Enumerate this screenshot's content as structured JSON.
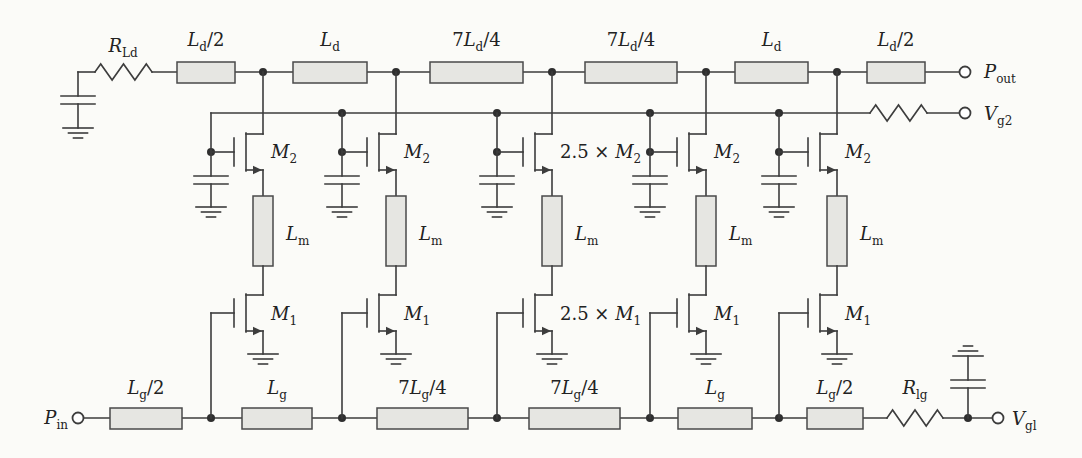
{
  "figure": {
    "kind": "circuit-schematic"
  },
  "colors": {
    "line": "#3d3d3d",
    "inductor_fill": "#e6e6e2",
    "background": "#fbfbf8",
    "text": "#222222"
  },
  "drain_line": {
    "termination_resistor_label": [
      {
        "t": "R",
        "i": true
      },
      {
        "t": "Ld",
        "s": true
      }
    ],
    "inductor_labels": [
      [
        {
          "t": "L",
          "i": true
        },
        {
          "t": "d",
          "s": true
        },
        {
          "t": "/2"
        }
      ],
      [
        {
          "t": "L",
          "i": true
        },
        {
          "t": "d",
          "s": true
        }
      ],
      [
        {
          "t": "7"
        },
        {
          "t": "L",
          "i": true
        },
        {
          "t": "d",
          "s": true
        },
        {
          "t": "/4"
        }
      ],
      [
        {
          "t": "7"
        },
        {
          "t": "L",
          "i": true
        },
        {
          "t": "d",
          "s": true
        },
        {
          "t": "/4"
        }
      ],
      [
        {
          "t": "L",
          "i": true
        },
        {
          "t": "d",
          "s": true
        }
      ],
      [
        {
          "t": "L",
          "i": true
        },
        {
          "t": "d",
          "s": true
        },
        {
          "t": "/2"
        }
      ]
    ],
    "output_terminal_label": [
      {
        "t": "P",
        "i": true
      },
      {
        "t": "out",
        "s": true
      }
    ]
  },
  "gate2_bias": {
    "terminal_label": [
      {
        "t": "V",
        "i": true
      },
      {
        "t": "g2",
        "s": true
      }
    ]
  },
  "cells": [
    {
      "m2_label": [
        {
          "t": "M",
          "i": true
        },
        {
          "t": "2",
          "s": true
        }
      ],
      "lm_label": [
        {
          "t": "L",
          "i": true
        },
        {
          "t": "m",
          "s": true
        }
      ],
      "m1_label": [
        {
          "t": "M",
          "i": true
        },
        {
          "t": "1",
          "s": true
        }
      ]
    },
    {
      "m2_label": [
        {
          "t": "M",
          "i": true
        },
        {
          "t": "2",
          "s": true
        }
      ],
      "lm_label": [
        {
          "t": "L",
          "i": true
        },
        {
          "t": "m",
          "s": true
        }
      ],
      "m1_label": [
        {
          "t": "M",
          "i": true
        },
        {
          "t": "1",
          "s": true
        }
      ]
    },
    {
      "m2_label": [
        {
          "t": "2.5 × "
        },
        {
          "t": "M",
          "i": true
        },
        {
          "t": "2",
          "s": true
        }
      ],
      "lm_label": [
        {
          "t": "L",
          "i": true
        },
        {
          "t": "m",
          "s": true
        }
      ],
      "m1_label": [
        {
          "t": "2.5 × "
        },
        {
          "t": "M",
          "i": true
        },
        {
          "t": "1",
          "s": true
        }
      ]
    },
    {
      "m2_label": [
        {
          "t": "M",
          "i": true
        },
        {
          "t": "2",
          "s": true
        }
      ],
      "lm_label": [
        {
          "t": "L",
          "i": true
        },
        {
          "t": "m",
          "s": true
        }
      ],
      "m1_label": [
        {
          "t": "M",
          "i": true
        },
        {
          "t": "1",
          "s": true
        }
      ]
    },
    {
      "m2_label": [
        {
          "t": "M",
          "i": true
        },
        {
          "t": "2",
          "s": true
        }
      ],
      "lm_label": [
        {
          "t": "L",
          "i": true
        },
        {
          "t": "m",
          "s": true
        }
      ],
      "m1_label": [
        {
          "t": "M",
          "i": true
        },
        {
          "t": "1",
          "s": true
        }
      ]
    }
  ],
  "gate_line": {
    "input_terminal_label": [
      {
        "t": "P",
        "i": true
      },
      {
        "t": "in",
        "s": true
      }
    ],
    "inductor_labels": [
      [
        {
          "t": "L",
          "i": true
        },
        {
          "t": "g",
          "s": true
        },
        {
          "t": "/2"
        }
      ],
      [
        {
          "t": "L",
          "i": true
        },
        {
          "t": "g",
          "s": true
        }
      ],
      [
        {
          "t": "7"
        },
        {
          "t": "L",
          "i": true
        },
        {
          "t": "g",
          "s": true
        },
        {
          "t": "/4"
        }
      ],
      [
        {
          "t": "7"
        },
        {
          "t": "L",
          "i": true
        },
        {
          "t": "g",
          "s": true
        },
        {
          "t": "/4"
        }
      ],
      [
        {
          "t": "L",
          "i": true
        },
        {
          "t": "g",
          "s": true
        }
      ],
      [
        {
          "t": "L",
          "i": true
        },
        {
          "t": "g",
          "s": true
        },
        {
          "t": "/2"
        }
      ]
    ],
    "termination_resistor_label": [
      {
        "t": "R",
        "i": true
      },
      {
        "t": "lg",
        "s": true
      }
    ],
    "bias_terminal_label": [
      {
        "t": "V",
        "i": true
      },
      {
        "t": "gl",
        "s": true
      }
    ]
  }
}
